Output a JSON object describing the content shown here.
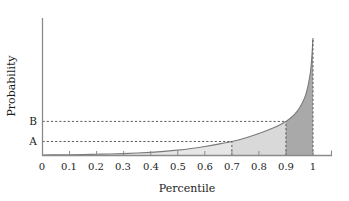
{
  "chart_data": {
    "type": "area",
    "title": "",
    "xlabel": "Percentile",
    "ylabel": "Probability",
    "xlim": [
      0,
      1
    ],
    "ylim": [
      0,
      1
    ],
    "grid": false,
    "legend_position": "none",
    "x_tick_labels": [
      "0",
      "0.1",
      "0.2",
      "0.3",
      "0.4",
      "0.5",
      "0.6",
      "0.7",
      "0.8",
      "0.9",
      "1"
    ],
    "x_tick_values": [
      0,
      0.1,
      0.2,
      0.3,
      0.4,
      0.5,
      0.6,
      0.7,
      0.8,
      0.9,
      1
    ],
    "y_tick_labels": [
      "A",
      "B"
    ],
    "y_tick_values": [
      0.102,
      0.248
    ],
    "series": [
      {
        "name": "probability-curve",
        "x": [
          0,
          0.05,
          0.1,
          0.15,
          0.2,
          0.25,
          0.3,
          0.35,
          0.4,
          0.45,
          0.5,
          0.55,
          0.6,
          0.65,
          0.7,
          0.75,
          0.8,
          0.85,
          0.9,
          0.93,
          0.95,
          0.97,
          0.98,
          0.99,
          0.995,
          1
        ],
        "y": [
          0.004,
          0.005,
          0.006,
          0.007,
          0.009,
          0.011,
          0.014,
          0.018,
          0.023,
          0.03,
          0.039,
          0.051,
          0.066,
          0.083,
          0.102,
          0.128,
          0.16,
          0.198,
          0.248,
          0.295,
          0.345,
          0.425,
          0.492,
          0.6,
          0.7,
          0.855
        ],
        "color": "#7a7a7a"
      }
    ],
    "shaded_regions": [
      {
        "name": "light-region",
        "x_from": 0.7,
        "x_to": 0.9,
        "color": "#d9d9d9"
      },
      {
        "name": "dark-region",
        "x_from": 0.9,
        "x_to": 1.0,
        "color": "#a9a9a9"
      }
    ],
    "reference_lines": [
      {
        "name": "level-A",
        "label": "A",
        "orientation": "horizontal",
        "value": 0.102,
        "x_to": 0.7,
        "style": "dashed"
      },
      {
        "name": "level-B",
        "label": "B",
        "orientation": "horizontal",
        "value": 0.248,
        "x_to": 0.9,
        "style": "dashed"
      },
      {
        "name": "percentile-70",
        "orientation": "vertical",
        "value": 0.7,
        "style": "dashed"
      },
      {
        "name": "percentile-90",
        "orientation": "vertical",
        "value": 0.9,
        "style": "dashed"
      },
      {
        "name": "percentile-100",
        "orientation": "vertical",
        "value": 1.0,
        "style": "dashed"
      }
    ],
    "colors": {
      "axis": "#8a8a8a",
      "curve": "#7a7a7a",
      "light_fill": "#d9d9d9",
      "dark_fill": "#a9a9a9",
      "text": "#1c1c1c",
      "dashed": "#4a4a4a"
    }
  }
}
